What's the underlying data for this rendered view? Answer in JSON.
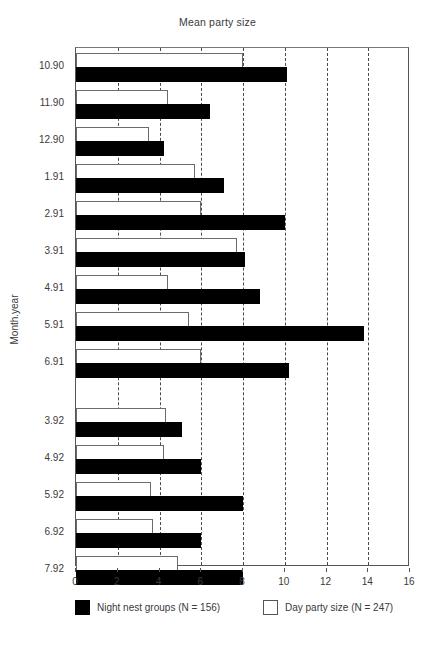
{
  "chart_data": {
    "type": "bar",
    "orientation": "horizontal",
    "title": "Mean party size",
    "xlabel": "",
    "ylabel": "Month.year",
    "xlim": [
      0,
      16
    ],
    "xticks": [
      0,
      2,
      4,
      6,
      8,
      10,
      12,
      14,
      16
    ],
    "xtick_labels": [
      "0",
      "2",
      "4",
      "6",
      "8",
      "10",
      "12",
      "14",
      "16"
    ],
    "grid": "vertical-dashed",
    "legend_position": "below-axes",
    "categories": [
      "10.90",
      "11.90",
      "12.90",
      "1.91",
      "2.91",
      "3.91",
      "4.91",
      "5.91",
      "6.91",
      "3.92",
      "4.92",
      "5.92",
      "6.92",
      "7.92"
    ],
    "group_break_after": "6.91",
    "series": [
      {
        "name": "Night nest groups (N = 156)",
        "color": "#000000",
        "fill": "solid-black",
        "values": [
          10.1,
          6.4,
          4.2,
          7.1,
          10.0,
          8.1,
          8.8,
          13.8,
          10.2,
          5.1,
          6.0,
          8.0,
          6.0,
          8.0
        ]
      },
      {
        "name": "Day party size (N = 247)",
        "color": "#ffffff",
        "fill": "open-white",
        "values": [
          8.0,
          4.4,
          3.5,
          5.7,
          6.0,
          7.7,
          4.4,
          5.4,
          6.0,
          4.3,
          4.2,
          3.6,
          3.7,
          4.9
        ]
      }
    ]
  },
  "legend": {
    "night_label": "Night nest groups (N = 156)",
    "day_label": "Day party size (N = 247)"
  }
}
